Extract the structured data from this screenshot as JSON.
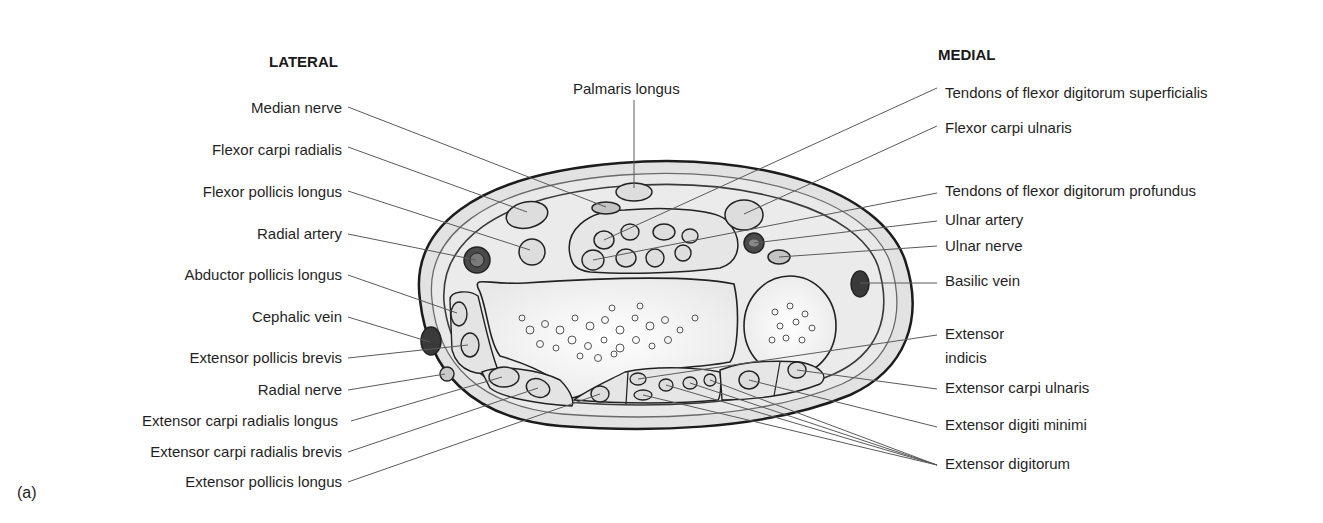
{
  "figure": {
    "panel_label": "(a)",
    "orientation": {
      "lateral": "LATERAL",
      "medial": "MEDIAL"
    },
    "top_label": "Palmaris longus",
    "left_labels": [
      "Median nerve",
      "Flexor carpi radialis",
      "Flexor pollicis longus",
      "Radial artery",
      "Abductor pollicis longus",
      "Cephalic vein",
      "Extensor pollicis brevis",
      "Radial nerve",
      "Extensor carpi radialis longus",
      "Extensor carpi radialis brevis",
      "Extensor pollicis longus"
    ],
    "right_labels": [
      "Tendons of flexor digitorum superficialis",
      "Flexor carpi ulnaris",
      "Tendons of flexor digitorum profundus",
      "Ulnar artery",
      "Ulnar nerve",
      "Basilic vein",
      "Extensor",
      "indicis",
      "Extensor carpi ulnaris",
      "Extensor digiti minimi",
      "Extensor digitorum"
    ],
    "colors": {
      "skin_fill": "#e4e4e4",
      "compartment_fill": "#ececec",
      "bone_fill": "#fbfbfb",
      "outline": "#222222",
      "leader": "#555555",
      "vessel_dark": "#3a3a3a",
      "vessel_mid": "#777777"
    }
  }
}
